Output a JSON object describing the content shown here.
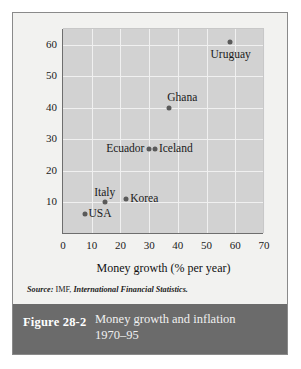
{
  "figure": {
    "number_label": "Figure 28-2",
    "title_line1": "Money growth and inflation",
    "title_line2": "1970–95",
    "source_prefix": "Source:",
    "source_publisher": "IMF,",
    "source_title": "International Financial Statistics.",
    "caption_bar_color": "#6b6b6b",
    "plot_background_color": "#d2d2d2",
    "point_color": "#5a5a5a"
  },
  "chart_data": {
    "type": "scatter",
    "title": "Money growth and inflation 1970–95",
    "xlabel": "Money growth (% per year)",
    "ylabel": "Inflation (% per year)",
    "xlim": [
      0,
      70
    ],
    "ylim": [
      0,
      65
    ],
    "xticks": [
      0,
      10,
      20,
      30,
      40,
      50,
      60,
      70
    ],
    "yticks": [
      10,
      20,
      30,
      40,
      50,
      60
    ],
    "grid": true,
    "legend": "none",
    "points": [
      {
        "label": "Uruguay",
        "x": 58,
        "y": 61,
        "label_pos": "below-right"
      },
      {
        "label": "Ghana",
        "x": 37,
        "y": 40,
        "label_pos": "above-right"
      },
      {
        "label": "Iceland",
        "x": 32,
        "y": 27,
        "label_pos": "right"
      },
      {
        "label": "Ecuador",
        "x": 30,
        "y": 27,
        "label_pos": "left"
      },
      {
        "label": "Korea",
        "x": 22,
        "y": 11,
        "label_pos": "right"
      },
      {
        "label": "Italy",
        "x": 14.5,
        "y": 10,
        "label_pos": "above"
      },
      {
        "label": "USA",
        "x": 7.5,
        "y": 6.5,
        "label_pos": "right"
      }
    ]
  }
}
